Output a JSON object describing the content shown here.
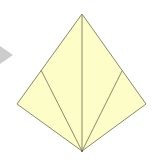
{
  "diagram": {
    "type": "origami-fold-step",
    "colors": {
      "paper": "#fdfdc8",
      "edge": "#8a8a6a",
      "arrow": "#c8c8c8",
      "background": "#ffffff"
    },
    "shape": {
      "top": [
        82,
        14
      ],
      "right": [
        146,
        104
      ],
      "bottom": [
        82,
        151
      ],
      "left": [
        17,
        104
      ]
    },
    "folds": [
      {
        "from": [
          82,
          14
        ],
        "to": [
          82,
          151
        ]
      },
      {
        "from": [
          41,
          70
        ],
        "to": [
          82,
          151
        ]
      },
      {
        "from": [
          122,
          71
        ],
        "to": [
          82,
          151
        ]
      }
    ],
    "arrow": {
      "points": [
        [
          0,
          47
        ],
        [
          12,
          55
        ],
        [
          0,
          63
        ]
      ]
    }
  }
}
